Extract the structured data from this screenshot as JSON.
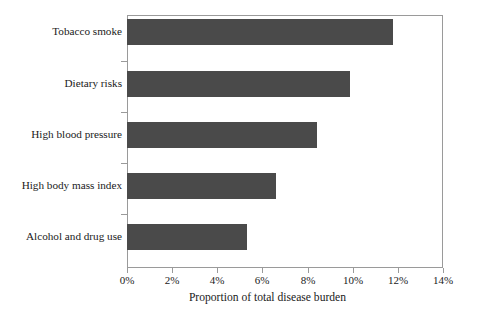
{
  "chart_data": {
    "type": "bar",
    "orientation": "horizontal",
    "title": "",
    "xlabel": "Proportion of total disease burden",
    "ylabel": "",
    "categories": [
      "Tobacco smoke",
      "Dietary risks",
      "High blood pressure",
      "High body mass index",
      "Alcohol and drug use"
    ],
    "values": [
      11.8,
      9.9,
      8.4,
      6.6,
      5.3
    ],
    "value_unit": "%",
    "xlim": [
      0,
      14
    ],
    "xticks": [
      0,
      2,
      4,
      6,
      8,
      10,
      12,
      14
    ],
    "xtick_labels": [
      "0%",
      "2%",
      "4%",
      "6%",
      "8%",
      "10%",
      "12%",
      "14%"
    ],
    "grid": false,
    "legend": null,
    "bar_color": "#4a4a4a",
    "frame_color": "#9a9a9a",
    "background": "#ffffff"
  }
}
